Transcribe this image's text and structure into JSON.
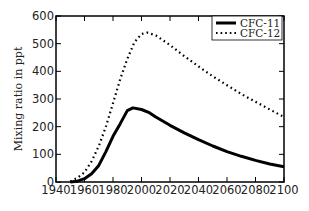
{
  "chart_data": {
    "type": "line",
    "title": "",
    "xlabel": "",
    "ylabel": "Mixing ratio in ppt",
    "xlim": [
      1940,
      2100
    ],
    "ylim": [
      0,
      600
    ],
    "xticks": [
      1940,
      1960,
      1980,
      2000,
      2020,
      2040,
      2060,
      2080,
      2100
    ],
    "yticks": [
      0,
      100,
      200,
      300,
      400,
      500,
      600
    ],
    "grid": false,
    "legend_position": "upper right",
    "series": [
      {
        "name": "CFC-11",
        "style": "solid",
        "x": [
          1950,
          1955,
          1960,
          1965,
          1970,
          1975,
          1980,
          1985,
          1990,
          1994,
          2000,
          2005,
          2010,
          2020,
          2030,
          2040,
          2050,
          2060,
          2070,
          2080,
          2090,
          2100
        ],
        "values": [
          0,
          3,
          12,
          30,
          60,
          110,
          165,
          210,
          258,
          268,
          262,
          252,
          235,
          205,
          178,
          153,
          130,
          110,
          93,
          78,
          65,
          55
        ]
      },
      {
        "name": "CFC-12",
        "style": "dotted",
        "x": [
          1950,
          1955,
          1960,
          1965,
          1970,
          1975,
          1980,
          1985,
          1990,
          1995,
          2000,
          2004,
          2010,
          2020,
          2030,
          2040,
          2050,
          2060,
          2070,
          2080,
          2090,
          2100
        ],
        "values": [
          2,
          15,
          35,
          75,
          130,
          200,
          285,
          370,
          445,
          505,
          535,
          540,
          530,
          495,
          455,
          418,
          382,
          350,
          318,
          290,
          262,
          235
        ]
      }
    ]
  }
}
